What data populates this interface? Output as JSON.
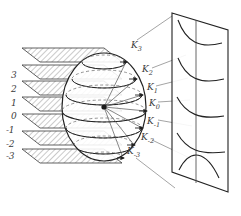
{
  "figure": {
    "kind": "mathematical-diagram",
    "stroke_color": "#222222",
    "dash_color": "#666666",
    "hatch_color": "#777777",
    "leader_color": "#888888",
    "background": "#ffffff"
  },
  "axis_labels": [
    {
      "value": "3",
      "y": 76
    },
    {
      "value": "2",
      "y": 90
    },
    {
      "value": "1",
      "y": 104
    },
    {
      "value": "0",
      "y": 117
    },
    {
      "value": "-1",
      "y": 131
    },
    {
      "value": "-2",
      "y": 145
    },
    {
      "value": "-3",
      "y": 157
    }
  ],
  "k_labels": [
    {
      "base": "K",
      "sub": "3",
      "x": 131,
      "y": 46
    },
    {
      "base": "K",
      "sub": "2",
      "x": 142,
      "y": 70
    },
    {
      "base": "K",
      "sub": "1",
      "x": 147,
      "y": 88
    },
    {
      "base": "K",
      "sub": "0",
      "x": 149,
      "y": 104
    },
    {
      "base": "K",
      "sub": "-1",
      "x": 147,
      "y": 122
    },
    {
      "base": "K",
      "sub": "-2",
      "x": 141,
      "y": 138
    },
    {
      "base": "K",
      "sub": "-3",
      "x": 127,
      "y": 152
    }
  ],
  "planes": {
    "count": 7,
    "fill": "hatched",
    "label": "cutting-plane"
  },
  "sphere": {
    "center_x": 104,
    "center_y": 107,
    "radius_x": 42,
    "radius_y": 54,
    "latitude_circle_count": 7,
    "label": "sphere"
  },
  "panel": {
    "label": "projection-plane",
    "curve_count": 5,
    "corners": "parallelogram"
  }
}
